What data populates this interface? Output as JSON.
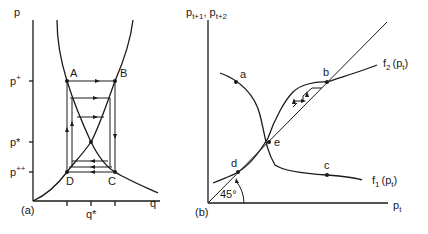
{
  "panel_a": {
    "tag": "(a)",
    "y_axis_label": "p",
    "x_axis_label": "q",
    "y_ticks": {
      "p_plus": "p",
      "p_plus_sup": "+",
      "p_star": "p*",
      "p_plus_plus": "p",
      "p_plus_plus_sup": "++"
    },
    "x_tick": "q*",
    "points": {
      "A": "A",
      "B": "B",
      "C": "C",
      "D": "D"
    }
  },
  "panel_b": {
    "tag": "(b)",
    "y_axis_label": "p",
    "y_axis_sub1": "t+1",
    "y_axis_sep": ",",
    "y_axis_label2": "p",
    "y_axis_sub2": "t+2",
    "x_axis_label": "p",
    "x_axis_sub": "t",
    "angle_label": "45°",
    "curve_f2": {
      "name": "f",
      "sub": "2",
      "arg": "(p",
      "arg_sub": "t",
      "close": ")"
    },
    "curve_f1": {
      "name": "f",
      "sub": "1",
      "arg": "(p",
      "arg_sub": "t",
      "close": ")"
    },
    "points": {
      "a": "a",
      "b": "b",
      "c": "c",
      "d": "d",
      "e": "e"
    }
  }
}
